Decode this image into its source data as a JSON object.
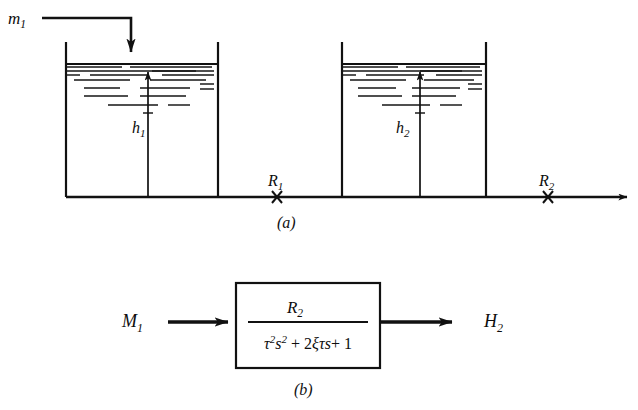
{
  "figure": {
    "background_color": "#ffffff",
    "ink_color": "#111111",
    "panels": [
      {
        "id": "a",
        "caption": "(a)",
        "description": "two interacting liquid level tanks on a common base line"
      },
      {
        "id": "b",
        "caption": "(b)",
        "description": "block diagram of second order transfer function"
      }
    ]
  },
  "panel_a": {
    "inlet": {
      "label": "m",
      "subscript": "1",
      "icon": "down-arrow-icon"
    },
    "tank1": {
      "level_label": "h",
      "level_subscript": "1",
      "level_arrow_icon": "up-arrow-icon"
    },
    "tank2": {
      "level_label": "h",
      "level_subscript": "2",
      "level_arrow_icon": "up-arrow-icon"
    },
    "resistance1": {
      "label": "R",
      "subscript": "1",
      "marker": "x-marker-icon"
    },
    "resistance2": {
      "label": "R",
      "subscript": "2",
      "marker": "x-marker-icon"
    },
    "outflow_arrow_icon": "right-arrow-icon",
    "caption": "(a)"
  },
  "panel_b": {
    "input": {
      "label": "M",
      "subscript": "1"
    },
    "output": {
      "label": "H",
      "subscript": "2"
    },
    "transfer_function": {
      "numerator": "R",
      "numerator_subscript": "2",
      "denominator": "τ²s² + 2ξτs + 1",
      "denominator_parts": {
        "tau": "τ",
        "tau_exp": "2",
        "s": "s",
        "s_exp": "2",
        "plus": "+",
        "two": "2",
        "xi": "ξ",
        "one": "1"
      }
    },
    "input_arrow_icon": "right-arrow-icon",
    "output_arrow_icon": "right-arrow-icon",
    "caption": "(b)"
  },
  "hatch_pattern": {
    "tank1": [
      {
        "x1": 66,
        "x2": 122,
        "y": 67
      },
      {
        "x1": 130,
        "x2": 212,
        "y": 67
      },
      {
        "x1": 66,
        "x2": 214,
        "y": 71
      },
      {
        "x1": 152,
        "x2": 196,
        "y": 71
      },
      {
        "x1": 66,
        "x2": 80,
        "y": 75
      },
      {
        "x1": 90,
        "x2": 148,
        "y": 75
      },
      {
        "x1": 162,
        "x2": 214,
        "y": 75
      },
      {
        "x1": 74,
        "x2": 130,
        "y": 80
      },
      {
        "x1": 150,
        "x2": 206,
        "y": 80
      },
      {
        "x1": 200,
        "x2": 214,
        "y": 84
      },
      {
        "x1": 84,
        "x2": 120,
        "y": 88
      },
      {
        "x1": 140,
        "x2": 190,
        "y": 88
      },
      {
        "x1": 200,
        "x2": 214,
        "y": 89
      },
      {
        "x1": 84,
        "x2": 128,
        "y": 96
      },
      {
        "x1": 140,
        "x2": 186,
        "y": 96
      },
      {
        "x1": 108,
        "x2": 158,
        "y": 105
      },
      {
        "x1": 168,
        "x2": 190,
        "y": 105
      },
      {
        "x1": 143,
        "x2": 153,
        "y": 113
      }
    ],
    "tank2": [
      {
        "x1": 342,
        "x2": 398,
        "y": 67
      },
      {
        "x1": 406,
        "x2": 480,
        "y": 67
      },
      {
        "x1": 342,
        "x2": 482,
        "y": 71
      },
      {
        "x1": 420,
        "x2": 462,
        "y": 71
      },
      {
        "x1": 342,
        "x2": 356,
        "y": 75
      },
      {
        "x1": 366,
        "x2": 424,
        "y": 75
      },
      {
        "x1": 436,
        "x2": 482,
        "y": 75
      },
      {
        "x1": 350,
        "x2": 406,
        "y": 80
      },
      {
        "x1": 424,
        "x2": 474,
        "y": 80
      },
      {
        "x1": 468,
        "x2": 482,
        "y": 84
      },
      {
        "x1": 358,
        "x2": 396,
        "y": 88
      },
      {
        "x1": 412,
        "x2": 460,
        "y": 88
      },
      {
        "x1": 468,
        "x2": 482,
        "y": 89
      },
      {
        "x1": 358,
        "x2": 402,
        "y": 96
      },
      {
        "x1": 412,
        "x2": 456,
        "y": 96
      },
      {
        "x1": 382,
        "x2": 430,
        "y": 105
      },
      {
        "x1": 440,
        "x2": 462,
        "y": 105
      },
      {
        "x1": 415,
        "x2": 425,
        "y": 113
      }
    ]
  }
}
